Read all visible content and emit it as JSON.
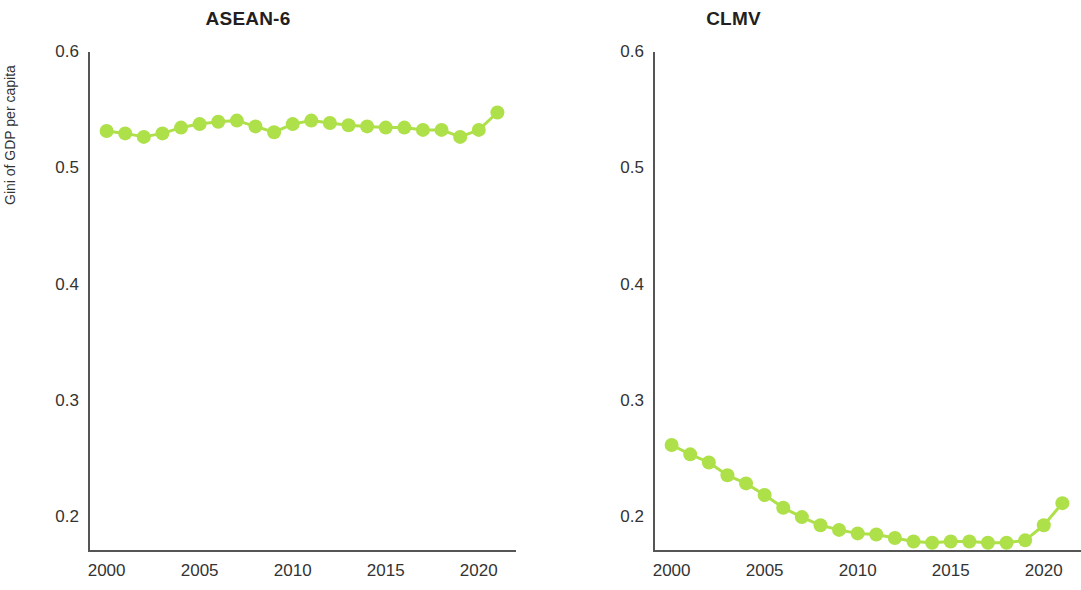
{
  "figure": {
    "background": "#ffffff",
    "accent": "#AEE04A"
  },
  "axis_label_y": "Gini of GDP per capita",
  "panels": [
    {
      "key": "asean6",
      "title": "ASEAN-6"
    },
    {
      "key": "clmv",
      "title": "CLMV"
    }
  ],
  "chart_data": [
    {
      "type": "line",
      "title": "ASEAN-6",
      "xlabel": "",
      "ylabel": "Gini of GDP per capita",
      "xlim": [
        1999.0,
        2022.0
      ],
      "ylim": [
        0.17,
        0.6
      ],
      "yticks": [
        0.2,
        0.3,
        0.4,
        0.5,
        0.6
      ],
      "ytick_labels": [
        "0.2",
        "0.3",
        "0.4",
        "0.5",
        "0.6"
      ],
      "xticks": [
        2000,
        2005,
        2010,
        2015,
        2020
      ],
      "xtick_labels": [
        "2000",
        "2005",
        "2010",
        "2015",
        "2020"
      ],
      "grid": false,
      "legend": "none",
      "marker": "circle",
      "color": "#AEE04A",
      "x": [
        2000,
        2001,
        2002,
        2003,
        2004,
        2005,
        2006,
        2007,
        2008,
        2009,
        2010,
        2011,
        2012,
        2013,
        2014,
        2015,
        2016,
        2017,
        2018,
        2019,
        2020,
        2021
      ],
      "values": [
        0.532,
        0.53,
        0.527,
        0.53,
        0.535,
        0.538,
        0.54,
        0.541,
        0.536,
        0.531,
        0.538,
        0.541,
        0.539,
        0.537,
        0.536,
        0.535,
        0.535,
        0.533,
        0.533,
        0.527,
        0.533,
        0.548
      ]
    },
    {
      "type": "line",
      "title": "CLMV",
      "xlabel": "",
      "ylabel": "",
      "xlim": [
        1999.0,
        2022.0
      ],
      "ylim": [
        0.17,
        0.6
      ],
      "yticks": [
        0.2,
        0.3,
        0.4,
        0.5,
        0.6
      ],
      "ytick_labels": [
        "0.2",
        "0.3",
        "0.4",
        "0.5",
        "0.6"
      ],
      "xticks": [
        2000,
        2005,
        2010,
        2015,
        2020
      ],
      "xtick_labels": [
        "2000",
        "2005",
        "2010",
        "2015",
        "2020"
      ],
      "grid": false,
      "legend": "none",
      "marker": "circle",
      "color": "#AEE04A",
      "x": [
        2000,
        2001,
        2002,
        2003,
        2004,
        2005,
        2006,
        2007,
        2008,
        2009,
        2010,
        2011,
        2012,
        2013,
        2014,
        2015,
        2016,
        2017,
        2018,
        2019,
        2020,
        2021
      ],
      "values": [
        0.262,
        0.254,
        0.247,
        0.236,
        0.229,
        0.219,
        0.208,
        0.2,
        0.193,
        0.189,
        0.186,
        0.185,
        0.182,
        0.179,
        0.178,
        0.179,
        0.179,
        0.178,
        0.178,
        0.18,
        0.193,
        0.212
      ]
    }
  ]
}
